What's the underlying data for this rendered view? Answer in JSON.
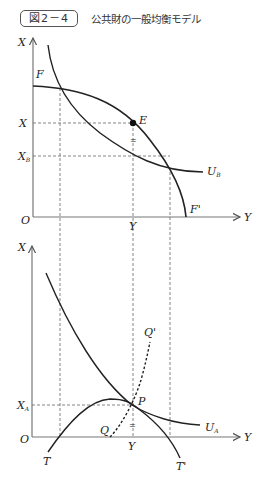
{
  "header": {
    "figure_label": "図2－4",
    "title": "公共財の一般均衡モデル"
  },
  "top_chart": {
    "y_axis_label": "X",
    "x_axis_label": "Y",
    "origin_label": "O",
    "curve_start_label": "F",
    "curve_end_label": "F'",
    "equilibrium_label": "E",
    "indifference_label": "U",
    "indifference_sub": "B",
    "level_x_label": "X",
    "level_xb_label": "X",
    "level_xb_sub": "B",
    "tick_y_label": "Y",
    "equal_mark": "="
  },
  "bottom_chart": {
    "y_axis_label": "X",
    "x_axis_label": "Y",
    "origin_label": "O",
    "level_xa_label": "X",
    "level_xa_sub": "A",
    "point_label": "P",
    "indifference_label": "U",
    "indifference_sub": "A",
    "curve_start_label": "T",
    "curve_end_label": "T'",
    "dashed_start_label": "Q",
    "dashed_end_label": "Q'",
    "tick_y_label": "Y",
    "equal_mark": "="
  }
}
